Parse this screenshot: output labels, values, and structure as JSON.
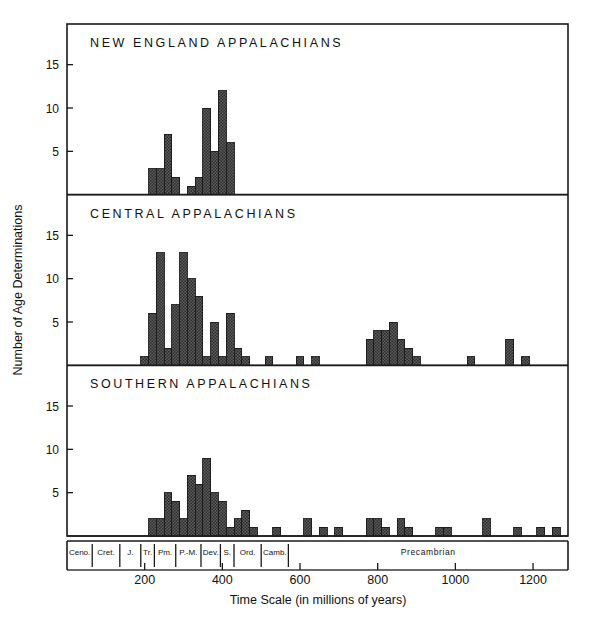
{
  "chart_data": {
    "type": "bar",
    "xlabel": "Time Scale (in millions of years)",
    "ylabel": "Number of Age Determinations",
    "xlim": [
      0,
      1290
    ],
    "ylim": [
      0,
      19
    ],
    "grid": false,
    "legend_position": "none",
    "bin_width": 20,
    "xticks": [
      200,
      400,
      600,
      800,
      1000,
      1200
    ],
    "yticks": [
      5,
      10,
      15
    ],
    "period_axis_label": "Precambrian",
    "periods": [
      {
        "abbr": "Ceno.",
        "start": 0,
        "end": 65
      },
      {
        "abbr": "Cret.",
        "start": 65,
        "end": 136
      },
      {
        "abbr": "J.",
        "start": 136,
        "end": 190
      },
      {
        "abbr": "Tr.",
        "start": 190,
        "end": 225
      },
      {
        "abbr": "Pm.",
        "start": 225,
        "end": 280
      },
      {
        "abbr": "P.-M.",
        "start": 280,
        "end": 345
      },
      {
        "abbr": "Dev.",
        "start": 345,
        "end": 395
      },
      {
        "abbr": "S.",
        "start": 395,
        "end": 430
      },
      {
        "abbr": "Ord.",
        "start": 430,
        "end": 500
      },
      {
        "abbr": "Camb.",
        "start": 500,
        "end": 570
      }
    ],
    "panels": [
      {
        "name": "new-england",
        "title": "NEW ENGLAND APPALACHIANS",
        "categories": [
          230,
          250,
          270,
          290,
          310,
          330,
          350,
          370,
          390,
          410
        ],
        "values": [
          3,
          3,
          7,
          2,
          0,
          1,
          2,
          10,
          5,
          12,
          6
        ]
      },
      {
        "name": "central",
        "title": "CENTRAL APPALACHIANS",
        "categories": [
          210,
          230,
          250,
          270,
          290,
          310,
          330,
          350,
          370,
          390,
          410,
          430
        ],
        "values": [
          1,
          6,
          13,
          2,
          7,
          13,
          10,
          8,
          1,
          5,
          1,
          6,
          2,
          1
        ],
        "tail_bins": [
          {
            "x": 510,
            "v": 1
          },
          {
            "x": 590,
            "v": 1
          },
          {
            "x": 630,
            "v": 1
          },
          {
            "x": 770,
            "v": 3
          },
          {
            "x": 790,
            "v": 4
          },
          {
            "x": 810,
            "v": 4
          },
          {
            "x": 830,
            "v": 5
          },
          {
            "x": 850,
            "v": 3
          },
          {
            "x": 870,
            "v": 2
          },
          {
            "x": 890,
            "v": 1
          },
          {
            "x": 1030,
            "v": 1
          },
          {
            "x": 1130,
            "v": 3
          },
          {
            "x": 1170,
            "v": 1
          }
        ]
      },
      {
        "name": "southern",
        "title": "SOUTHERN APPALACHIANS",
        "categories": [
          230,
          250,
          270,
          290,
          310,
          330,
          350,
          370,
          390,
          410,
          430
        ],
        "values": [
          2,
          2,
          5,
          4,
          2,
          7,
          6,
          9,
          5,
          4,
          1,
          2,
          3,
          1
        ],
        "tail_bins": [
          {
            "x": 530,
            "v": 1
          },
          {
            "x": 610,
            "v": 2
          },
          {
            "x": 650,
            "v": 1
          },
          {
            "x": 690,
            "v": 1
          },
          {
            "x": 770,
            "v": 2
          },
          {
            "x": 790,
            "v": 2
          },
          {
            "x": 810,
            "v": 1
          },
          {
            "x": 850,
            "v": 2
          },
          {
            "x": 870,
            "v": 1
          },
          {
            "x": 950,
            "v": 1
          },
          {
            "x": 970,
            "v": 1
          },
          {
            "x": 1070,
            "v": 2
          },
          {
            "x": 1150,
            "v": 1
          },
          {
            "x": 1210,
            "v": 1
          },
          {
            "x": 1250,
            "v": 1
          }
        ]
      }
    ]
  },
  "axis": {
    "xtick_labels": [
      "200",
      "400",
      "600",
      "800",
      "1000",
      "1200"
    ],
    "ytick_labels": [
      "5",
      "10",
      "15"
    ],
    "x_title": "Time Scale (in millions of years)",
    "y_title": "Number of Age Determinations"
  },
  "panel_titles": {
    "top": "NEW ENGLAND APPALACHIANS",
    "middle": "CENTRAL APPALACHIANS",
    "bottom": "SOUTHERN APPALACHIANS"
  },
  "period_labels": [
    "Ceno.",
    "Cret.",
    "J.",
    "Tr.",
    "Pm.",
    "P.-M.",
    "Dev.",
    "S.",
    "Ord.",
    "Camb."
  ],
  "precambrian_label": "Precambrian",
  "colors": {
    "bar_fill": "#595959",
    "bar_stroke": "#1a1a1a",
    "frame": "#1a1a1a",
    "text": "#111111",
    "background": "#ffffff"
  }
}
